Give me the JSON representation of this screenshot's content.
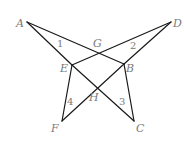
{
  "diagram": {
    "points": {
      "A": {
        "label": "A",
        "x": 27,
        "y": 22,
        "lx": 16,
        "ly": 27
      },
      "D": {
        "label": "D",
        "x": 171,
        "y": 22,
        "lx": 173,
        "ly": 27
      },
      "E": {
        "label": "E",
        "x": 72,
        "y": 65,
        "lx": 60,
        "ly": 72
      },
      "B": {
        "label": "B",
        "x": 124,
        "y": 64,
        "lx": 126,
        "ly": 72
      },
      "F": {
        "label": "F",
        "x": 62,
        "y": 121,
        "lx": 51,
        "ly": 132
      },
      "C": {
        "label": "C",
        "x": 134,
        "y": 121,
        "lx": 136,
        "ly": 132
      },
      "G": {
        "label": "G",
        "x": 98,
        "y": 51,
        "lx": 93,
        "ly": 47
      },
      "H": {
        "label": "H",
        "x": 96,
        "y": 88,
        "lx": 89,
        "ly": 101
      }
    },
    "segments": [
      [
        "A",
        "B"
      ],
      [
        "A",
        "E"
      ],
      [
        "D",
        "E"
      ],
      [
        "D",
        "B"
      ],
      [
        "E",
        "F"
      ],
      [
        "E",
        "C"
      ],
      [
        "B",
        "F"
      ],
      [
        "B",
        "C"
      ]
    ],
    "angle_labels": [
      {
        "label": "1",
        "x": 57,
        "y": 47
      },
      {
        "label": "2",
        "x": 130,
        "y": 49
      },
      {
        "label": "3",
        "x": 119,
        "y": 105
      },
      {
        "label": "4",
        "x": 67,
        "y": 105
      }
    ]
  }
}
